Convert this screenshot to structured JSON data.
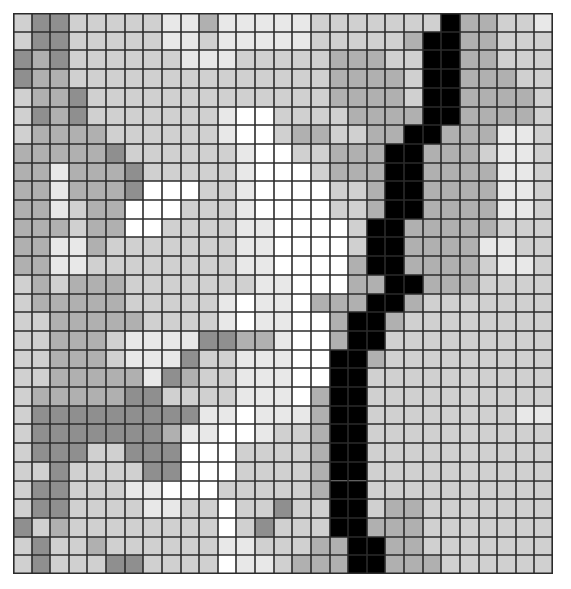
{
  "page": {
    "title": "Grayscale Pixel Grid",
    "background_color": "#ffffff",
    "width": 571,
    "height": 589
  },
  "grid": {
    "name": "grayscale-cell-grid",
    "columns": 29,
    "rows": 30,
    "cell_width": 18.62,
    "cell_height": 18.7,
    "origin_x": 13,
    "origin_y": 13,
    "gridline_color": "#2b2b2b",
    "gridline_width": 1.6,
    "palette": {
      "0": "#ffffff",
      "1": "#e8e8e8",
      "2": "#d0d0d0",
      "3": "#b0b0b0",
      "4": "#8f8f8f",
      "5": "#000000"
    },
    "palette_labels": {
      "0": "white",
      "1": "very-light-gray",
      "2": "light-gray",
      "3": "medium-gray",
      "4": "dark-gray",
      "5": "black"
    }
  },
  "chart_data": {
    "type": "heatmap",
    "title": "Grayscale Pixel Grid",
    "xlabel": "",
    "ylabel": "",
    "legend": [],
    "grid": true,
    "ncols": 29,
    "nrows": 30,
    "value_levels": [
      0,
      1,
      2,
      3,
      4,
      5
    ],
    "level_colors": [
      "#ffffff",
      "#e8e8e8",
      "#d0d0d0",
      "#b0b0b0",
      "#8f8f8f",
      "#000000"
    ],
    "matrix": [
      [
        2,
        4,
        4,
        2,
        2,
        2,
        2,
        2,
        1,
        1,
        3,
        1,
        1,
        1,
        1,
        1,
        2,
        2,
        2,
        2,
        2,
        2,
        2,
        5,
        3,
        3,
        2,
        2,
        1
      ],
      [
        2,
        4,
        4,
        2,
        2,
        2,
        2,
        2,
        1,
        1,
        2,
        1,
        1,
        1,
        1,
        1,
        2,
        2,
        2,
        2,
        2,
        3,
        5,
        5,
        3,
        3,
        2,
        2,
        2
      ],
      [
        4,
        3,
        4,
        2,
        2,
        2,
        2,
        2,
        2,
        1,
        1,
        1,
        2,
        2,
        2,
        2,
        2,
        3,
        3,
        3,
        2,
        2,
        5,
        5,
        3,
        3,
        2,
        2,
        2
      ],
      [
        4,
        3,
        3,
        2,
        2,
        2,
        2,
        2,
        2,
        2,
        2,
        2,
        2,
        2,
        2,
        2,
        2,
        3,
        3,
        3,
        3,
        2,
        5,
        5,
        3,
        3,
        3,
        2,
        2
      ],
      [
        2,
        3,
        3,
        4,
        2,
        2,
        2,
        2,
        2,
        2,
        2,
        2,
        2,
        2,
        2,
        2,
        2,
        3,
        3,
        3,
        3,
        2,
        5,
        5,
        3,
        3,
        3,
        3,
        2
      ],
      [
        2,
        4,
        3,
        4,
        2,
        2,
        2,
        2,
        2,
        2,
        2,
        1,
        0,
        0,
        2,
        2,
        2,
        2,
        3,
        3,
        3,
        3,
        5,
        5,
        3,
        3,
        3,
        3,
        2
      ],
      [
        2,
        3,
        3,
        3,
        3,
        2,
        2,
        2,
        2,
        2,
        2,
        1,
        0,
        0,
        2,
        3,
        3,
        2,
        2,
        3,
        3,
        5,
        5,
        3,
        3,
        3,
        1,
        1,
        2
      ],
      [
        3,
        3,
        3,
        3,
        3,
        4,
        2,
        2,
        2,
        2,
        2,
        2,
        1,
        0,
        0,
        2,
        2,
        3,
        3,
        3,
        5,
        5,
        3,
        3,
        3,
        2,
        1,
        1,
        2
      ],
      [
        3,
        3,
        1,
        3,
        3,
        3,
        4,
        2,
        2,
        2,
        2,
        2,
        1,
        0,
        0,
        0,
        2,
        3,
        3,
        3,
        5,
        5,
        3,
        3,
        3,
        3,
        1,
        1,
        2
      ],
      [
        3,
        3,
        1,
        3,
        3,
        3,
        4,
        0,
        0,
        0,
        2,
        2,
        1,
        0,
        0,
        0,
        0,
        2,
        2,
        3,
        5,
        5,
        3,
        3,
        3,
        3,
        1,
        1,
        2
      ],
      [
        3,
        3,
        1,
        2,
        3,
        3,
        0,
        0,
        0,
        2,
        2,
        2,
        1,
        0,
        0,
        0,
        0,
        2,
        2,
        3,
        5,
        5,
        3,
        3,
        3,
        3,
        1,
        1,
        2
      ],
      [
        3,
        3,
        3,
        2,
        3,
        3,
        0,
        0,
        2,
        2,
        2,
        2,
        1,
        1,
        0,
        0,
        0,
        0,
        2,
        5,
        5,
        3,
        3,
        3,
        3,
        3,
        2,
        2,
        2
      ],
      [
        3,
        3,
        1,
        1,
        3,
        2,
        2,
        2,
        2,
        2,
        2,
        2,
        1,
        1,
        0,
        0,
        0,
        0,
        2,
        5,
        5,
        3,
        3,
        3,
        3,
        1,
        1,
        2,
        2
      ],
      [
        3,
        3,
        1,
        1,
        2,
        2,
        2,
        2,
        2,
        2,
        2,
        2,
        1,
        1,
        0,
        0,
        0,
        0,
        3,
        5,
        5,
        3,
        3,
        3,
        3,
        2,
        1,
        1,
        2
      ],
      [
        2,
        3,
        2,
        3,
        3,
        3,
        2,
        2,
        2,
        2,
        2,
        2,
        2,
        1,
        1,
        0,
        0,
        0,
        3,
        3,
        5,
        5,
        3,
        3,
        3,
        2,
        2,
        2,
        2
      ],
      [
        2,
        3,
        3,
        3,
        3,
        3,
        2,
        2,
        2,
        2,
        2,
        1,
        0,
        1,
        1,
        0,
        3,
        3,
        3,
        5,
        5,
        3,
        2,
        2,
        2,
        2,
        2,
        2,
        2
      ],
      [
        2,
        2,
        3,
        3,
        3,
        3,
        3,
        2,
        2,
        2,
        2,
        1,
        0,
        1,
        1,
        0,
        0,
        3,
        5,
        5,
        3,
        2,
        2,
        2,
        2,
        2,
        2,
        2,
        2
      ],
      [
        2,
        2,
        3,
        3,
        3,
        2,
        1,
        1,
        1,
        1,
        4,
        4,
        3,
        3,
        1,
        0,
        0,
        3,
        5,
        5,
        2,
        2,
        2,
        2,
        2,
        2,
        2,
        2,
        2
      ],
      [
        2,
        2,
        3,
        3,
        3,
        2,
        1,
        1,
        1,
        4,
        2,
        2,
        1,
        1,
        1,
        0,
        0,
        5,
        5,
        3,
        2,
        2,
        2,
        2,
        2,
        2,
        2,
        2,
        2
      ],
      [
        2,
        2,
        3,
        3,
        3,
        3,
        3,
        1,
        4,
        3,
        2,
        2,
        1,
        1,
        1,
        0,
        0,
        5,
        5,
        2,
        2,
        2,
        2,
        2,
        2,
        2,
        2,
        2,
        2
      ],
      [
        2,
        3,
        3,
        3,
        3,
        3,
        4,
        4,
        2,
        2,
        2,
        2,
        1,
        1,
        1,
        0,
        3,
        5,
        5,
        2,
        2,
        2,
        2,
        2,
        2,
        2,
        2,
        2,
        2
      ],
      [
        2,
        4,
        4,
        4,
        4,
        4,
        4,
        4,
        4,
        4,
        1,
        1,
        0,
        1,
        1,
        1,
        3,
        5,
        5,
        2,
        2,
        2,
        2,
        2,
        2,
        2,
        2,
        1,
        1
      ],
      [
        2,
        4,
        4,
        4,
        4,
        4,
        4,
        4,
        3,
        1,
        1,
        0,
        0,
        1,
        2,
        2,
        3,
        5,
        5,
        2,
        2,
        2,
        2,
        2,
        2,
        2,
        2,
        2,
        2
      ],
      [
        2,
        4,
        4,
        4,
        2,
        2,
        4,
        4,
        4,
        0,
        0,
        0,
        2,
        2,
        2,
        2,
        3,
        5,
        5,
        2,
        2,
        2,
        2,
        2,
        2,
        2,
        2,
        2,
        2
      ],
      [
        2,
        2,
        4,
        2,
        2,
        2,
        2,
        4,
        4,
        0,
        0,
        0,
        2,
        2,
        2,
        2,
        3,
        5,
        5,
        2,
        2,
        2,
        2,
        2,
        2,
        2,
        2,
        2,
        2
      ],
      [
        2,
        4,
        4,
        2,
        2,
        2,
        1,
        1,
        0,
        0,
        0,
        2,
        2,
        2,
        2,
        2,
        3,
        5,
        5,
        2,
        2,
        2,
        2,
        2,
        2,
        2,
        2,
        2,
        2
      ],
      [
        2,
        4,
        4,
        2,
        2,
        2,
        2,
        1,
        1,
        2,
        2,
        0,
        2,
        2,
        4,
        2,
        2,
        5,
        5,
        2,
        3,
        3,
        2,
        2,
        2,
        2,
        2,
        2,
        2
      ],
      [
        4,
        2,
        3,
        2,
        2,
        2,
        2,
        2,
        2,
        2,
        2,
        0,
        2,
        4,
        2,
        2,
        2,
        5,
        5,
        3,
        3,
        3,
        2,
        2,
        2,
        2,
        2,
        2,
        2
      ],
      [
        2,
        4,
        2,
        2,
        3,
        2,
        2,
        2,
        2,
        2,
        2,
        1,
        1,
        2,
        2,
        2,
        3,
        3,
        5,
        5,
        3,
        3,
        2,
        2,
        2,
        2,
        2,
        2,
        2
      ],
      [
        2,
        4,
        2,
        2,
        2,
        4,
        4,
        2,
        2,
        2,
        2,
        0,
        1,
        1,
        2,
        3,
        3,
        3,
        5,
        5,
        3,
        3,
        3,
        2,
        2,
        2,
        2,
        2,
        2
      ]
    ]
  }
}
